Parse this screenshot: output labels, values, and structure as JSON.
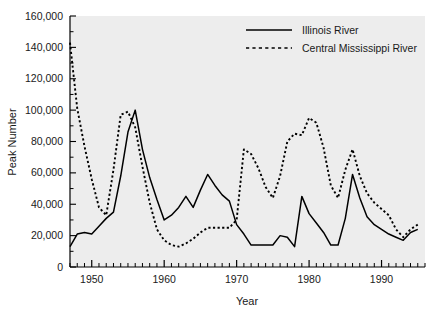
{
  "chart_data": {
    "type": "line",
    "title": "",
    "xlabel": "Year",
    "ylabel": "Peak Number",
    "xlim": [
      1947,
      1996
    ],
    "ylim": [
      0,
      160000
    ],
    "grid": false,
    "legend_position": "top-right",
    "y_ticks": [
      0,
      20000,
      40000,
      60000,
      80000,
      100000,
      120000,
      140000,
      160000
    ],
    "y_tick_labels": [
      "0",
      "20,000",
      "40,000",
      "60,000",
      "80,000",
      "100,000",
      "120,000",
      "140,000",
      "160,000"
    ],
    "x_ticks": [
      1950,
      1960,
      1970,
      1980,
      1990
    ],
    "x_tick_labels": [
      "1950",
      "1960",
      "1970",
      "1980",
      "1990"
    ],
    "x_minor_tick_interval": 1,
    "x": [
      1947,
      1948,
      1949,
      1950,
      1951,
      1952,
      1953,
      1954,
      1955,
      1956,
      1957,
      1958,
      1959,
      1960,
      1961,
      1962,
      1963,
      1964,
      1965,
      1966,
      1967,
      1968,
      1969,
      1970,
      1971,
      1972,
      1973,
      1974,
      1975,
      1976,
      1977,
      1978,
      1979,
      1980,
      1981,
      1982,
      1983,
      1984,
      1985,
      1986,
      1987,
      1988,
      1989,
      1990,
      1991,
      1992,
      1993,
      1994,
      1995
    ],
    "series": [
      {
        "name": "Illinois River",
        "style": "solid",
        "color": "#000000",
        "values": [
          13000,
          21000,
          22000,
          21000,
          26000,
          31000,
          35000,
          58000,
          86000,
          100000,
          75000,
          57000,
          43000,
          30000,
          33000,
          38000,
          45000,
          38000,
          49000,
          59000,
          52000,
          46000,
          42000,
          27000,
          21000,
          14000,
          14000,
          14000,
          14000,
          20000,
          19000,
          13000,
          45000,
          34000,
          28000,
          22000,
          14000,
          14000,
          31000,
          59000,
          44000,
          32000,
          27000,
          24000,
          21000,
          19000,
          17000,
          22000,
          24000
        ]
      },
      {
        "name": "Central Mississippi River",
        "style": "dotted",
        "color": "#000000",
        "values": [
          143000,
          101000,
          77000,
          56000,
          38000,
          33000,
          62000,
          97000,
          99000,
          89000,
          64000,
          41000,
          24000,
          17000,
          14000,
          13000,
          15000,
          18000,
          22000,
          25000,
          25000,
          25000,
          25000,
          30000,
          75000,
          72000,
          63000,
          51000,
          44000,
          58000,
          80000,
          85000,
          84000,
          95000,
          92000,
          76000,
          52000,
          44000,
          62000,
          75000,
          58000,
          47000,
          41000,
          37000,
          33000,
          24000,
          19000,
          24000,
          27000
        ]
      }
    ]
  },
  "legend": {
    "items": [
      {
        "label": "Illinois River",
        "style": "solid"
      },
      {
        "label": "Central Mississippi River",
        "style": "dotted"
      }
    ]
  }
}
